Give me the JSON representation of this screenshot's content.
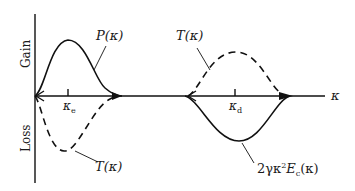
{
  "diagram": {
    "y_axis": {
      "upper_label": "Gain",
      "lower_label": "Loss"
    },
    "x_axis": {
      "label": "κ"
    },
    "ticks": [
      {
        "symbol": "κ",
        "subscript": "e"
      },
      {
        "symbol": "κ",
        "subscript": "d"
      }
    ],
    "curves": [
      {
        "name": "P(κ)",
        "style": "solid",
        "region": "gain",
        "peak_at": "κe"
      },
      {
        "name": "T(κ)",
        "style": "dashed",
        "region": "loss",
        "peak_at": "κe"
      },
      {
        "name": "T(κ)",
        "style": "dashed",
        "region": "gain",
        "peak_at": "κd"
      },
      {
        "name": "2γκ²Ec(κ)",
        "style": "solid",
        "region": "loss",
        "peak_at": "κd"
      }
    ],
    "labels": {
      "p_kappa": "P(κ)",
      "t_kappa_upper": "T(κ)",
      "t_kappa_lower": "T(κ)",
      "dissipation_prefix": "2γκ",
      "dissipation_sup": "2",
      "dissipation_E": "E",
      "dissipation_sub": "c",
      "dissipation_suffix": "(κ)"
    }
  }
}
